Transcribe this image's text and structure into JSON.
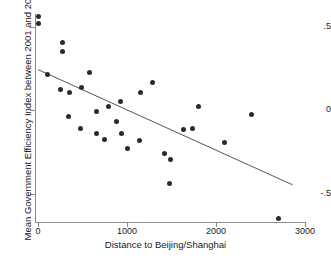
{
  "chart_data": {
    "type": "scatter",
    "title": "",
    "xlabel": "Distance to Beijing/Shanghai",
    "ylabel": "Mean Government Efficiency Index between 2001 and 2010",
    "xlim": [
      0,
      3000
    ],
    "ylim": [
      -0.72,
      0.62
    ],
    "xticks": [
      0,
      1000,
      2000,
      3000
    ],
    "xtick_labels": [
      "0",
      "1000",
      "2000",
      "3000"
    ],
    "yticks": [
      0.5,
      0,
      -0.5
    ],
    "ytick_labels": [
      ".5",
      "0",
      "-.5"
    ],
    "grid": false,
    "legend": "none",
    "marker_color": "#2b2b2b",
    "line_color": "#555555",
    "axis_color": "#8a8a8a",
    "points": [
      {
        "x": 10,
        "y": 0.56
      },
      {
        "x": 10,
        "y": 0.52
      },
      {
        "x": 275,
        "y": 0.41
      },
      {
        "x": 275,
        "y": 0.355
      },
      {
        "x": 110,
        "y": 0.215
      },
      {
        "x": 575,
        "y": 0.225
      },
      {
        "x": 255,
        "y": 0.125
      },
      {
        "x": 490,
        "y": 0.135
      },
      {
        "x": 350,
        "y": 0.105
      },
      {
        "x": 1290,
        "y": 0.165
      },
      {
        "x": 1150,
        "y": 0.105
      },
      {
        "x": 930,
        "y": 0.055
      },
      {
        "x": 795,
        "y": 0.025
      },
      {
        "x": 1800,
        "y": 0.025
      },
      {
        "x": 655,
        "y": -0.005
      },
      {
        "x": 345,
        "y": -0.035
      },
      {
        "x": 2400,
        "y": -0.025
      },
      {
        "x": 880,
        "y": -0.065
      },
      {
        "x": 1630,
        "y": -0.115
      },
      {
        "x": 1735,
        "y": -0.105
      },
      {
        "x": 480,
        "y": -0.105
      },
      {
        "x": 935,
        "y": -0.135
      },
      {
        "x": 660,
        "y": -0.135
      },
      {
        "x": 2100,
        "y": -0.19
      },
      {
        "x": 1145,
        "y": -0.18
      },
      {
        "x": 745,
        "y": -0.175
      },
      {
        "x": 1010,
        "y": -0.23
      },
      {
        "x": 1420,
        "y": -0.255
      },
      {
        "x": 1490,
        "y": -0.295
      },
      {
        "x": 1480,
        "y": -0.435
      },
      {
        "x": 2700,
        "y": -0.645
      }
    ],
    "fit_line": {
      "kind": "linear-fit",
      "x_start": 0,
      "y_start": 0.245,
      "x_end": 2860,
      "y_end": -0.445
    }
  }
}
